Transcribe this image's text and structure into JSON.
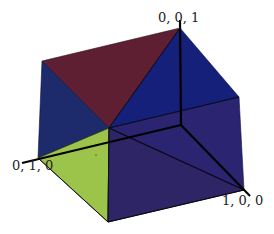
{
  "diagram": {
    "type": "3d-polyhedron",
    "colors": {
      "top_face": "#5e1f33",
      "upper_right_face": "#15207a",
      "left_face": "#1d2a6b",
      "green_face": "#9cc34a",
      "front_face": "#2e2567",
      "right_face": "#2b2470",
      "axis": "#000000",
      "edge": "#0a0a1a"
    },
    "axes": {
      "x_label": "1, 0, 0",
      "y_label": "0, 1, 0",
      "z_label": "0, 0, 1"
    },
    "vertices": {
      "top": [
        180,
        28
      ],
      "top_left": [
        42,
        61
      ],
      "right_upper": [
        239,
        97
      ],
      "center": [
        109,
        128
      ],
      "origin": [
        181,
        125
      ],
      "left": [
        38,
        158
      ],
      "bottom_right": [
        244,
        190
      ],
      "bottom": [
        108,
        222
      ]
    }
  }
}
